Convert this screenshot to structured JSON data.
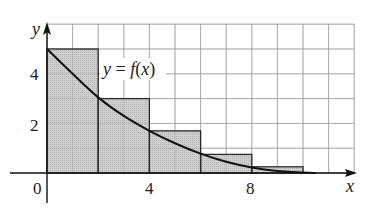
{
  "chart_data": {
    "type": "bar",
    "title": "",
    "xlabel": "x",
    "ylabel": "y",
    "curve_label": "y = f(x)",
    "curve_label_parts": {
      "lhs": "y",
      "eq": " = ",
      "f": "f",
      "open": "(",
      "x": "x",
      "close": ")"
    },
    "x_ticks": [
      0,
      4,
      8
    ],
    "y_ticks": [
      2,
      4
    ],
    "origin_label": "0",
    "xlim": [
      0,
      12
    ],
    "ylim": [
      0,
      6
    ],
    "grid": true,
    "grid_step": 1,
    "rectangles": [
      {
        "x_start": 0,
        "x_end": 2,
        "height": 5.0
      },
      {
        "x_start": 2,
        "x_end": 4,
        "height": 3.0
      },
      {
        "x_start": 4,
        "x_end": 6,
        "height": 1.7
      },
      {
        "x_start": 6,
        "x_end": 8,
        "height": 0.75
      },
      {
        "x_start": 8,
        "x_end": 10,
        "height": 0.25
      }
    ],
    "curve_points": [
      {
        "x": 0,
        "y": 5.0
      },
      {
        "x": 1,
        "y": 4.0
      },
      {
        "x": 2,
        "y": 3.05
      },
      {
        "x": 3,
        "y": 2.3
      },
      {
        "x": 4,
        "y": 1.7
      },
      {
        "x": 5,
        "y": 1.2
      },
      {
        "x": 6,
        "y": 0.78
      },
      {
        "x": 7,
        "y": 0.45
      },
      {
        "x": 8,
        "y": 0.22
      },
      {
        "x": 9,
        "y": 0.08
      },
      {
        "x": 10,
        "y": 0.02
      },
      {
        "x": 10.5,
        "y": 0.0
      }
    ],
    "colors": {
      "rect_fill": "#c8c8c8",
      "rect_stroke": "#2a2a2a",
      "curve": "#111111",
      "grid": "#b5b5b5",
      "axis": "#111111"
    }
  }
}
